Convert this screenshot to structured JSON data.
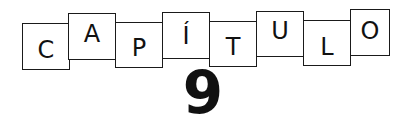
{
  "heading": {
    "letters": [
      "C",
      "A",
      "P",
      "Í",
      "T",
      "U",
      "L",
      "O"
    ],
    "number": "9"
  }
}
